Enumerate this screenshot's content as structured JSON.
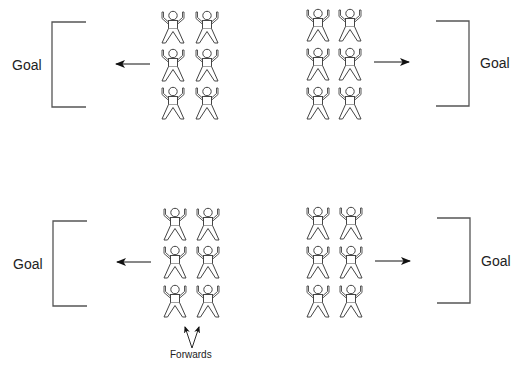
{
  "diagram": {
    "colors": {
      "stroke": "#555555",
      "figure_stroke": "#444444",
      "arrow": "#111111",
      "text": "#222222",
      "background": "#ffffff"
    },
    "panels": [
      {
        "id": "top",
        "left_goal": {
          "label": "Goal",
          "bracket": {
            "x": 52,
            "top": 22,
            "bottom": 107,
            "end": 86
          },
          "label_pos": [
            12,
            58
          ]
        },
        "right_goal": {
          "label": "Goal",
          "bracket": {
            "x": 469,
            "top": 21,
            "bottom": 106,
            "end": 436
          },
          "label_pos": [
            480,
            56
          ]
        },
        "left_arrow": {
          "from": [
            150,
            64
          ],
          "to": [
            116,
            64
          ],
          "direction": "left"
        },
        "right_arrow": {
          "from": [
            374,
            62
          ],
          "to": [
            409,
            62
          ],
          "direction": "right"
        },
        "left_team": {
          "columns_x": [
            161,
            195
          ],
          "rows_y": [
            10,
            48,
            86
          ]
        },
        "right_team": {
          "columns_x": [
            306,
            338
          ],
          "rows_y": [
            8,
            47,
            86
          ]
        }
      },
      {
        "id": "bottom",
        "left_goal": {
          "label": "Goal",
          "bracket": {
            "x": 53,
            "top": 221,
            "bottom": 306,
            "end": 87
          },
          "label_pos": [
            13,
            257
          ]
        },
        "right_goal": {
          "label": "Goal",
          "bracket": {
            "x": 470,
            "top": 218,
            "bottom": 303,
            "end": 437
          },
          "label_pos": [
            481,
            254
          ]
        },
        "left_arrow": {
          "from": [
            151,
            262
          ],
          "to": [
            117,
            262
          ],
          "direction": "left"
        },
        "right_arrow": {
          "from": [
            375,
            261
          ],
          "to": [
            410,
            261
          ],
          "direction": "right"
        },
        "left_team": {
          "columns_x": [
            163,
            196
          ],
          "rows_y": [
            207,
            245,
            284
          ]
        },
        "right_team": {
          "columns_x": [
            306,
            339
          ],
          "rows_y": [
            206,
            245,
            284
          ]
        }
      }
    ],
    "forwards_annotation": {
      "label": "Forwards",
      "label_pos": [
        170,
        350
      ],
      "vertex": [
        192,
        348
      ],
      "left_tip": [
        185,
        327
      ],
      "right_tip": [
        199,
        327
      ]
    },
    "figure_icon": "person-arms-raised-icon",
    "players_per_team": 6
  }
}
